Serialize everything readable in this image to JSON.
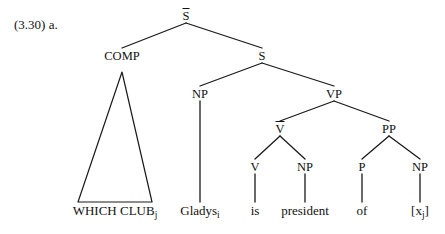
{
  "figure": {
    "example_number": "(3.30)",
    "sub_label": "a.",
    "caption_full": "(3.30) a."
  },
  "tree": {
    "nodes": {
      "sbar": {
        "label": "S",
        "has_overline": true,
        "x": 186,
        "y": 17
      },
      "comp": {
        "label": "COMP",
        "has_overline": false,
        "x": 122,
        "y": 57
      },
      "s": {
        "label": "S",
        "has_overline": false,
        "x": 262,
        "y": 57
      },
      "np_subject": {
        "label": "NP",
        "has_overline": false,
        "x": 200,
        "y": 95
      },
      "vp": {
        "label": "VP",
        "has_overline": false,
        "x": 334,
        "y": 95
      },
      "vbar": {
        "label": "V",
        "has_overline": true,
        "x": 280,
        "y": 130
      },
      "pp": {
        "label": "PP",
        "has_overline": false,
        "x": 389,
        "y": 130
      },
      "v": {
        "label": "V",
        "has_overline": false,
        "x": 255,
        "y": 168
      },
      "np_predicate": {
        "label": "NP",
        "has_overline": false,
        "x": 305,
        "y": 168
      },
      "p": {
        "label": "P",
        "has_overline": false,
        "x": 362,
        "y": 168
      },
      "np_trace": {
        "label": "NP",
        "has_overline": false,
        "x": 420,
        "y": 168
      }
    },
    "terminals": {
      "which_club": {
        "text": "WHICH CLUB",
        "subscript": "j",
        "x": 115,
        "y": 211
      },
      "gladys": {
        "text": "Gladys",
        "subscript": "i",
        "x": 200,
        "y": 211
      },
      "is": {
        "text": "is",
        "subscript": "",
        "x": 255,
        "y": 211
      },
      "president": {
        "text": "president",
        "subscript": "",
        "x": 305,
        "y": 211
      },
      "of": {
        "text": "of",
        "subscript": "",
        "x": 362,
        "y": 211
      },
      "trace": {
        "text": "[x",
        "subscript": "j",
        "suffix": "]",
        "x": 420,
        "y": 211
      }
    },
    "triangle": {
      "apex_x": 122,
      "apex_y": 72,
      "left_x": 78,
      "right_x": 152,
      "base_y": 202
    },
    "style": {
      "line_color": "#1a1a1a",
      "line_width": 1.3,
      "background": "#ffffff"
    }
  }
}
